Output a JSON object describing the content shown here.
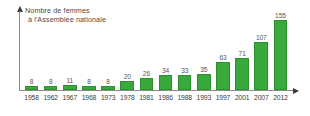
{
  "chart_data": {
    "type": "bar",
    "title": "Nombre de femmes à l'Assemblée nationale",
    "title_lines": [
      "Nombre de femmes",
      "à l'Assemblée nationale"
    ],
    "xlabel": "",
    "ylabel": "Nombre de femmes à l'Assemblée nationale",
    "categories": [
      "1958",
      "1962",
      "1967",
      "1968",
      "1973",
      "1978",
      "1981",
      "1986",
      "1988",
      "1993",
      "1997",
      "2001",
      "2007",
      "2012"
    ],
    "values": [
      8,
      8,
      11,
      8,
      8,
      20,
      26,
      34,
      33,
      35,
      63,
      71,
      107,
      155
    ],
    "ylim": [
      0,
      155
    ],
    "grid": false,
    "legend": null,
    "show_data_labels": true,
    "bar_color": "#3aa93c",
    "bar_border_color": "#2e8f31",
    "label_color": "#555555",
    "axis_color": "#8a8a8a",
    "tick_label_color": "#3d3d3d",
    "background_color": "#ffffff"
  }
}
